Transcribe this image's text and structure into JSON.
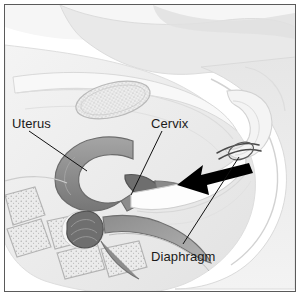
{
  "figure": {
    "kind": "anatomical-illustration",
    "frame": {
      "border_color": "#5a5a5a",
      "background_color": "#ffffff"
    },
    "labels": [
      {
        "id": "uterus",
        "text": "Uterus",
        "leader_from": {
          "x": 28,
          "y": 130
        },
        "leader_to": {
          "x": 82,
          "y": 166
        }
      },
      {
        "id": "cervix",
        "text": "Cervix",
        "leader_from": {
          "x": 159,
          "y": 130
        },
        "leader_to": {
          "x": 128,
          "y": 190
        }
      },
      {
        "id": "diaphragm",
        "text": "Diaphragm",
        "leader_from": {
          "x": 180,
          "y": 243
        },
        "leader_to": {
          "x": 236,
          "y": 158
        }
      }
    ],
    "arrow": {
      "id": "insertion-direction-arrow",
      "color": "#000000",
      "direction": "left",
      "tail": {
        "x": 240,
        "y": 163
      },
      "head": {
        "x": 176,
        "y": 182
      }
    },
    "structures": [
      {
        "id": "body-outline",
        "fill": "#ededed",
        "stroke": "#d3d3d3"
      },
      {
        "id": "abdominal-wall",
        "fill": "#e4e4e4",
        "stroke": "#cfcfcf"
      },
      {
        "id": "uterus-body",
        "fill": "#8f8f8f",
        "stroke": "#6d6d6d"
      },
      {
        "id": "cervix-body",
        "fill": "#707070",
        "stroke": "#585858"
      },
      {
        "id": "vaginal-canal",
        "fill": "#fbfbfb",
        "stroke": "#c8c8c8"
      },
      {
        "id": "bladder",
        "fill": "#f2f2f2",
        "stroke": "#cccccc"
      },
      {
        "id": "stippled-organ-upper",
        "fill": "#eeeeee",
        "stroke": "#b5b5b5",
        "texture": "stipple"
      },
      {
        "id": "sacral-vertebrae",
        "fill": "#e8e8e8",
        "stroke": "#b0b0b0",
        "texture": "stipple"
      },
      {
        "id": "rectum-coil",
        "fill": "#6a6a6a",
        "stroke": "#4e4e4e"
      },
      {
        "id": "rectum-tube",
        "fill": "#9a9a9a",
        "stroke": "#7a7a7a"
      },
      {
        "id": "diaphragm-ring",
        "fill": "#ffffff",
        "stroke": "#4a4a4a"
      }
    ],
    "colors": {
      "ink": "#1a1a1a",
      "leader_line": "#111111",
      "arrow": "#000000",
      "frame": "#5a5a5a",
      "wash_light": "#ededed",
      "wash_mid": "#c9c9c9",
      "wash_dark": "#8f8f8f"
    }
  }
}
